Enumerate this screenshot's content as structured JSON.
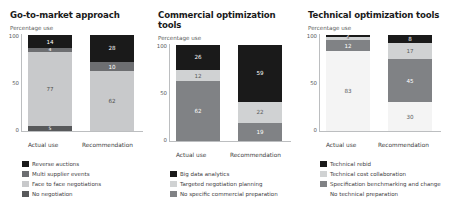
{
  "chart_data": [
    {
      "type": "bar",
      "stacked": true,
      "title": "Go-to-market approach",
      "subtitle": "Percentage use",
      "ylabel": "Percentage use",
      "xlabel": "",
      "ylim": [
        0,
        100
      ],
      "yticks": [
        "100",
        "50",
        "0"
      ],
      "categories": [
        "Actual use",
        "Recommendation"
      ],
      "grid": false,
      "legend_position": "bottom",
      "series": [
        {
          "name": "Reverse auctions",
          "values": [
            14,
            28
          ],
          "color": "#1a1a1a"
        },
        {
          "name": "Multi supplier events",
          "values": [
            4,
            10
          ],
          "color": "#6d6e71"
        },
        {
          "name": "Face to face negotiations",
          "values": [
            77,
            62
          ],
          "color": "#c8c9cb"
        },
        {
          "name": "No negotiation",
          "values": [
            5,
            0
          ],
          "color": "#58595b"
        }
      ]
    },
    {
      "type": "bar",
      "stacked": true,
      "title": "Commercial optimization tools",
      "subtitle": "Percentage use",
      "ylabel": "Percentage use",
      "xlabel": "",
      "ylim": [
        0,
        100
      ],
      "yticks": [
        "100",
        "50",
        "0"
      ],
      "categories": [
        "Actual use",
        "Recommendation"
      ],
      "grid": false,
      "legend_position": "bottom",
      "series": [
        {
          "name": "Big data analytics",
          "values": [
            26,
            59
          ],
          "color": "#1a1a1a"
        },
        {
          "name": "Targeted negotiation planning",
          "values": [
            12,
            22
          ],
          "color": "#d0d2d3"
        },
        {
          "name": "No specific commercial preparation",
          "values": [
            62,
            19
          ],
          "color": "#808285"
        }
      ]
    },
    {
      "type": "bar",
      "stacked": true,
      "title": "Technical optimization tools",
      "subtitle": "Percentage use",
      "ylabel": "Percentage use",
      "xlabel": "",
      "ylim": [
        0,
        100
      ],
      "yticks": [
        "100",
        "50",
        "0"
      ],
      "categories": [
        "Actual use",
        "Recommendation"
      ],
      "grid": false,
      "legend_position": "bottom",
      "series": [
        {
          "name": "Technical rebid",
          "values": [
            2,
            8
          ],
          "color": "#1a1a1a"
        },
        {
          "name": "Technical cost collaboration",
          "values": [
            3,
            17
          ],
          "color": "#d0d2d3"
        },
        {
          "name": "Specification benchmarking and change",
          "values": [
            12,
            45
          ],
          "color": "#808285"
        },
        {
          "name": "No technical preparation",
          "values": [
            83,
            30
          ],
          "color": "#f4f4f4"
        }
      ]
    }
  ],
  "panels": [
    {
      "title": "Go-to-market approach",
      "subtitle": "Percentage use",
      "ticks": {
        "top": "100",
        "mid": "50",
        "bottom": "0"
      },
      "categories": {
        "first": "Actual use",
        "second": "Recommendation"
      },
      "bar1": [
        {
          "label": "14",
          "pct": 14,
          "color": "#1a1a1a",
          "text": "#ffffff"
        },
        {
          "label": "4",
          "pct": 4,
          "color": "#6d6e71",
          "text": "#ffffff"
        },
        {
          "label": "77",
          "pct": 77,
          "color": "#c8c9cb",
          "text": "#4d4d4d"
        },
        {
          "label": "5",
          "pct": 5,
          "color": "#58595b",
          "text": "#ffffff"
        }
      ],
      "bar2": [
        {
          "label": "28",
          "pct": 28,
          "color": "#1a1a1a",
          "text": "#ffffff"
        },
        {
          "label": "10",
          "pct": 10,
          "color": "#6d6e71",
          "text": "#ffffff"
        },
        {
          "label": "62",
          "pct": 62,
          "color": "#c8c9cb",
          "text": "#4d4d4d"
        }
      ],
      "legend": [
        {
          "label": "Reverse auctions",
          "color": "#1a1a1a"
        },
        {
          "label": "Multi supplier events",
          "color": "#6d6e71"
        },
        {
          "label": "Face to face negotiations",
          "color": "#c8c9cb"
        },
        {
          "label": "No negotiation",
          "color": "#58595b"
        }
      ]
    },
    {
      "title": "Commercial optimization tools",
      "subtitle": "Percentage use",
      "ticks": {
        "top": "100",
        "mid": "50",
        "bottom": "0"
      },
      "categories": {
        "first": "Actual use",
        "second": "Recommendation"
      },
      "bar1": [
        {
          "label": "26",
          "pct": 26,
          "color": "#1a1a1a",
          "text": "#ffffff"
        },
        {
          "label": "12",
          "pct": 12,
          "color": "#d0d2d3",
          "text": "#58595b"
        },
        {
          "label": "62",
          "pct": 62,
          "color": "#808285",
          "text": "#ffffff"
        }
      ],
      "bar2": [
        {
          "label": "59",
          "pct": 59,
          "color": "#1a1a1a",
          "text": "#ffffff"
        },
        {
          "label": "22",
          "pct": 22,
          "color": "#d0d2d3",
          "text": "#58595b"
        },
        {
          "label": "19",
          "pct": 19,
          "color": "#808285",
          "text": "#ffffff"
        }
      ],
      "legend": [
        {
          "label": "Big data analytics",
          "color": "#1a1a1a"
        },
        {
          "label": "Targeted negotiation planning",
          "color": "#d0d2d3"
        },
        {
          "label": "No specific commercial preparation",
          "color": "#808285"
        }
      ]
    },
    {
      "title": "Technical optimization tools",
      "subtitle": "Percentage use",
      "ticks": {
        "top": "100",
        "mid": "50",
        "bottom": "0"
      },
      "categories": {
        "first": "Actual use",
        "second": "Recommendation"
      },
      "bar1": [
        {
          "label": "2",
          "pct": 2,
          "color": "#1a1a1a",
          "text": "#ffffff"
        },
        {
          "label": "3",
          "pct": 3,
          "color": "#d0d2d3",
          "text": "#58595b"
        },
        {
          "label": "12",
          "pct": 12,
          "color": "#808285",
          "text": "#ffffff"
        },
        {
          "label": "83",
          "pct": 83,
          "color": "#f4f4f4",
          "text": "#58595b"
        }
      ],
      "bar2": [
        {
          "label": "8",
          "pct": 8,
          "color": "#1a1a1a",
          "text": "#ffffff"
        },
        {
          "label": "17",
          "pct": 17,
          "color": "#d0d2d3",
          "text": "#58595b"
        },
        {
          "label": "45",
          "pct": 45,
          "color": "#808285",
          "text": "#ffffff"
        },
        {
          "label": "30",
          "pct": 30,
          "color": "#f4f4f4",
          "text": "#58595b"
        }
      ],
      "legend": [
        {
          "label": "Technical rebid",
          "color": "#1a1a1a"
        },
        {
          "label": "Technical cost collaboration",
          "color": "#d0d2d3"
        },
        {
          "label": "Specification benchmarking and change",
          "color": "#808285"
        },
        {
          "label": "No technical preparation",
          "color": "#ffffff"
        }
      ]
    }
  ]
}
